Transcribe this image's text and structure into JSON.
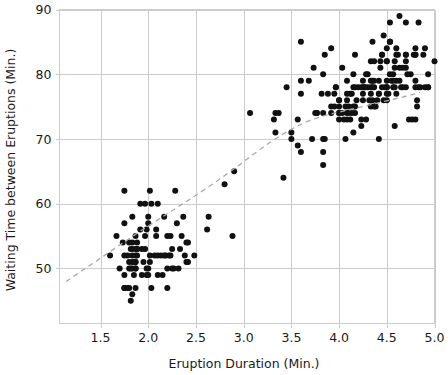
{
  "chart_data": {
    "type": "scatter",
    "title": "",
    "subtitle": "",
    "xlabel": "Eruption Duration (Min.)",
    "ylabel": "Waiting Time between Eruptions (Min.)",
    "xlim": [
      1.07,
      5.0
    ],
    "ylim": [
      41.5,
      90.0
    ],
    "xticks": [
      1.5,
      2.0,
      2.5,
      3.0,
      3.5,
      4.0,
      4.5,
      5.0
    ],
    "xtick_labels": [
      "1.5",
      "2.0",
      "2.5",
      "3.0",
      "3.5",
      "4.0",
      "4.5",
      "5.0"
    ],
    "yticks": [
      50,
      60,
      70,
      80,
      90
    ],
    "ytick_labels": [
      "50",
      "60",
      "70",
      "80",
      "90"
    ],
    "grid": true,
    "legend": false,
    "legend_position": "none",
    "point_color": "#111111",
    "point_size": 3.0,
    "grid_color": "#cccccc",
    "trend": {
      "name": "lowess smoother",
      "style": "dashed",
      "color": "#a9a9a9",
      "points": [
        [
          1.14,
          48.0
        ],
        [
          1.3,
          49.6
        ],
        [
          1.5,
          51.6
        ],
        [
          1.7,
          53.6
        ],
        [
          1.9,
          55.6
        ],
        [
          2.1,
          57.5
        ],
        [
          2.3,
          59.4
        ],
        [
          2.5,
          61.3
        ],
        [
          2.7,
          63.3
        ],
        [
          2.9,
          65.4
        ],
        [
          3.1,
          67.6
        ],
        [
          3.3,
          69.7
        ],
        [
          3.5,
          71.5
        ],
        [
          3.7,
          72.9
        ],
        [
          3.9,
          73.8
        ],
        [
          4.1,
          74.5
        ],
        [
          4.3,
          75.2
        ],
        [
          4.5,
          75.9
        ],
        [
          4.7,
          76.6
        ],
        [
          4.85,
          77.2
        ]
      ]
    },
    "series": [
      {
        "name": "Old Faithful eruptions",
        "marker": "circle",
        "points": [
          [
            3.6,
            79
          ],
          [
            1.8,
            54
          ],
          [
            3.333,
            74
          ],
          [
            2.283,
            62
          ],
          [
            4.533,
            85
          ],
          [
            2.883,
            55
          ],
          [
            4.7,
            88
          ],
          [
            3.6,
            85
          ],
          [
            1.95,
            51
          ],
          [
            4.35,
            85
          ],
          [
            1.833,
            54
          ],
          [
            3.917,
            84
          ],
          [
            4.2,
            78
          ],
          [
            1.75,
            47
          ],
          [
            4.7,
            83
          ],
          [
            2.167,
            52
          ],
          [
            1.75,
            62
          ],
          [
            4.8,
            84
          ],
          [
            1.6,
            52
          ],
          [
            4.25,
            79
          ],
          [
            1.8,
            51
          ],
          [
            1.75,
            47
          ],
          [
            3.45,
            78
          ],
          [
            3.067,
            74
          ],
          [
            4.533,
            85
          ],
          [
            3.6,
            77
          ],
          [
            1.967,
            60
          ],
          [
            4.083,
            76
          ],
          [
            3.85,
            83
          ],
          [
            4.433,
            81
          ],
          [
            4.3,
            78
          ],
          [
            4.467,
            76
          ],
          [
            3.367,
            74
          ],
          [
            4.033,
            81
          ],
          [
            3.833,
            66
          ],
          [
            2.017,
            62
          ],
          [
            1.867,
            50
          ],
          [
            4.833,
            88
          ],
          [
            1.833,
            51
          ],
          [
            4.783,
            83
          ],
          [
            4.35,
            79
          ],
          [
            1.883,
            53
          ],
          [
            4.567,
            79
          ],
          [
            1.75,
            57
          ],
          [
            4.533,
            80
          ],
          [
            3.317,
            73
          ],
          [
            3.833,
            70
          ],
          [
            2.1,
            60
          ],
          [
            4.633,
            79
          ],
          [
            2.0,
            58
          ],
          [
            4.8,
            83
          ],
          [
            4.716,
            80
          ],
          [
            1.833,
            52
          ],
          [
            4.833,
            78
          ],
          [
            1.733,
            54
          ],
          [
            4.883,
            83
          ],
          [
            3.717,
            70
          ],
          [
            1.667,
            55
          ],
          [
            4.567,
            78
          ],
          [
            4.317,
            76
          ],
          [
            2.233,
            52
          ],
          [
            4.5,
            78
          ],
          [
            1.75,
            49
          ],
          [
            4.8,
            83
          ],
          [
            1.817,
            45
          ],
          [
            4.4,
            76
          ],
          [
            4.167,
            74
          ],
          [
            4.7,
            82
          ],
          [
            2.067,
            52
          ],
          [
            4.7,
            83
          ],
          [
            4.033,
            74
          ],
          [
            1.967,
            55
          ],
          [
            4.5,
            82
          ],
          [
            4.0,
            76
          ],
          [
            1.983,
            56
          ],
          [
            5.067,
            80
          ],
          [
            2.017,
            51
          ],
          [
            4.567,
            80
          ],
          [
            3.883,
            77
          ],
          [
            3.6,
            68
          ],
          [
            4.133,
            77
          ],
          [
            4.333,
            75
          ],
          [
            4.1,
            74
          ],
          [
            2.633,
            58
          ],
          [
            4.067,
            75
          ],
          [
            4.933,
            78
          ],
          [
            3.95,
            77
          ],
          [
            4.517,
            77
          ],
          [
            2.167,
            58
          ],
          [
            4.0,
            75
          ],
          [
            2.2,
            50
          ],
          [
            4.333,
            82
          ],
          [
            1.867,
            52
          ],
          [
            4.817,
            75
          ],
          [
            1.833,
            58
          ],
          [
            4.3,
            80
          ],
          [
            4.667,
            78
          ],
          [
            3.75,
            74
          ],
          [
            1.867,
            47
          ],
          [
            4.9,
            78
          ],
          [
            2.483,
            52
          ],
          [
            4.367,
            82
          ],
          [
            2.1,
            52
          ],
          [
            4.5,
            79
          ],
          [
            4.05,
            73
          ],
          [
            1.867,
            53
          ],
          [
            4.7,
            81
          ],
          [
            1.783,
            47
          ],
          [
            4.85,
            78
          ],
          [
            3.683,
            79
          ],
          [
            4.733,
            73
          ],
          [
            2.3,
            57
          ],
          [
            4.9,
            84
          ],
          [
            4.417,
            70
          ],
          [
            1.7,
            50
          ],
          [
            4.633,
            89
          ],
          [
            2.317,
            50
          ],
          [
            4.6,
            83
          ],
          [
            1.817,
            53
          ],
          [
            4.417,
            77
          ],
          [
            2.617,
            56
          ],
          [
            4.067,
            70
          ],
          [
            4.25,
            76
          ],
          [
            1.967,
            53
          ],
          [
            4.6,
            84
          ],
          [
            3.767,
            74
          ],
          [
            1.917,
            60
          ],
          [
            4.5,
            78
          ],
          [
            2.267,
            50
          ],
          [
            4.65,
            78
          ],
          [
            1.867,
            50
          ],
          [
            4.167,
            75
          ],
          [
            2.8,
            63
          ],
          [
            4.333,
            78
          ],
          [
            1.833,
            46
          ],
          [
            4.383,
            75
          ],
          [
            1.883,
            54
          ],
          [
            4.933,
            80
          ],
          [
            2.033,
            47
          ],
          [
            3.733,
            81
          ],
          [
            4.233,
            72
          ],
          [
            2.233,
            55
          ],
          [
            4.533,
            85
          ],
          [
            4.817,
            76
          ],
          [
            4.333,
            77
          ],
          [
            1.983,
            50
          ],
          [
            4.633,
            81
          ],
          [
            2.017,
            52
          ],
          [
            5.1,
            82
          ],
          [
            1.8,
            50
          ],
          [
            5.033,
            85
          ],
          [
            4.0,
            73
          ],
          [
            2.4,
            51
          ],
          [
            4.6,
            79
          ],
          [
            3.567,
            73
          ],
          [
            4.0,
            76
          ],
          [
            4.5,
            77
          ],
          [
            4.083,
            79
          ],
          [
            1.8,
            47
          ],
          [
            3.967,
            78
          ],
          [
            2.2,
            55
          ],
          [
            4.15,
            80
          ],
          [
            2.0,
            49
          ],
          [
            3.833,
            74
          ],
          [
            3.5,
            70
          ],
          [
            4.583,
            82
          ],
          [
            2.367,
            58
          ],
          [
            5.0,
            82
          ],
          [
            1.933,
            53
          ],
          [
            4.617,
            83
          ],
          [
            1.917,
            56
          ],
          [
            2.083,
            56
          ],
          [
            4.583,
            72
          ],
          [
            3.333,
            71
          ],
          [
            4.167,
            78
          ],
          [
            4.333,
            79
          ],
          [
            4.5,
            76
          ],
          [
            2.417,
            54
          ],
          [
            4.0,
            74
          ],
          [
            4.167,
            83
          ],
          [
            1.883,
            53
          ],
          [
            4.583,
            81
          ],
          [
            4.25,
            77
          ],
          [
            3.767,
            74
          ],
          [
            2.033,
            60
          ],
          [
            4.433,
            82
          ],
          [
            4.083,
            73
          ],
          [
            1.833,
            53
          ],
          [
            4.417,
            79
          ],
          [
            2.183,
            52
          ],
          [
            4.8,
            78
          ],
          [
            1.833,
            50
          ],
          [
            4.8,
            79
          ],
          [
            4.1,
            75
          ],
          [
            3.966,
            78
          ],
          [
            4.233,
            73
          ],
          [
            3.5,
            71
          ],
          [
            4.366,
            79
          ],
          [
            2.25,
            53
          ],
          [
            4.667,
            81
          ],
          [
            2.1,
            49
          ],
          [
            4.35,
            78
          ],
          [
            4.133,
            74
          ],
          [
            1.867,
            55
          ],
          [
            4.6,
            77
          ],
          [
            1.783,
            52
          ],
          [
            4.367,
            75
          ],
          [
            3.85,
            70
          ],
          [
            1.933,
            49
          ],
          [
            4.5,
            84
          ],
          [
            2.383,
            52
          ],
          [
            4.7,
            78
          ],
          [
            1.867,
            51
          ],
          [
            3.833,
            80
          ],
          [
            3.417,
            64
          ],
          [
            4.233,
            78
          ],
          [
            2.4,
            54
          ],
          [
            4.8,
            73
          ],
          [
            2.0,
            57
          ],
          [
            4.15,
            78
          ],
          [
            1.867,
            51
          ],
          [
            4.267,
            78
          ],
          [
            1.75,
            52
          ],
          [
            4.483,
            78
          ],
          [
            4.0,
            74
          ],
          [
            4.117,
            77
          ],
          [
            4.083,
            77
          ],
          [
            4.267,
            78
          ],
          [
            3.917,
            75
          ],
          [
            4.55,
            79
          ],
          [
            4.083,
            74
          ],
          [
            2.417,
            51
          ],
          [
            4.183,
            76
          ],
          [
            2.217,
            52
          ],
          [
            4.45,
            78
          ],
          [
            1.883,
            52
          ],
          [
            1.85,
            49
          ],
          [
            4.283,
            80
          ],
          [
            3.95,
            75
          ],
          [
            2.333,
            53
          ],
          [
            4.15,
            71
          ],
          [
            2.35,
            55
          ],
          [
            4.933,
            78
          ],
          [
            2.9,
            65
          ],
          [
            4.583,
            78
          ],
          [
            3.833,
            68
          ],
          [
            2.083,
            55
          ],
          [
            4.367,
            78
          ],
          [
            2.133,
            52
          ],
          [
            4.35,
            76
          ],
          [
            2.2,
            47
          ],
          [
            4.45,
            83
          ],
          [
            3.567,
            69
          ],
          [
            4.5,
            82
          ],
          [
            4.15,
            75
          ],
          [
            3.817,
            77
          ],
          [
            3.917,
            74
          ],
          [
            4.45,
            83
          ],
          [
            2.0,
            50
          ],
          [
            4.283,
            73
          ],
          [
            4.767,
            73
          ],
          [
            4.533,
            88
          ],
          [
            1.85,
            51
          ],
          [
            4.25,
            78
          ],
          [
            1.983,
            49
          ],
          [
            2.25,
            50
          ],
          [
            4.75,
            80
          ],
          [
            4.117,
            73
          ],
          [
            2.15,
            49
          ],
          [
            4.417,
            77
          ],
          [
            1.817,
            50
          ],
          [
            4.467,
            86
          ]
        ]
      }
    ]
  },
  "axes": {
    "xlabel": "Eruption Duration (Min.)",
    "ylabel": "Waiting Time between Eruptions (Min.)"
  }
}
